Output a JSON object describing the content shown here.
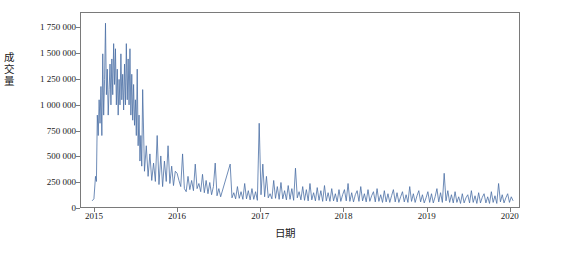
{
  "chart_data": {
    "type": "line",
    "title": "",
    "xlabel": "日期",
    "ylabel": "成交量",
    "xlim": [
      "2014-11-01",
      "2020-02-15"
    ],
    "ylim": [
      0,
      1900000
    ],
    "grid": false,
    "legend": null,
    "line_color": "#4a6fa5",
    "axis_color": "#7a7a7a",
    "yticks": [
      {
        "value": 0,
        "label": "0"
      },
      {
        "value": 250000,
        "label": "250 000"
      },
      {
        "value": 500000,
        "label": "500 000"
      },
      {
        "value": 750000,
        "label": "750 000"
      },
      {
        "value": 1000000,
        "label": "1 000 000"
      },
      {
        "value": 1250000,
        "label": "1 250 000"
      },
      {
        "value": 1500000,
        "label": "1 500 000"
      },
      {
        "value": 1750000,
        "label": "1 750 000"
      }
    ],
    "xticks": [
      {
        "value": "2015-01-01",
        "label": "2015"
      },
      {
        "value": "2016-01-01",
        "label": "2016"
      },
      {
        "value": "2017-01-01",
        "label": "2017"
      },
      {
        "value": "2018-01-01",
        "label": "2018"
      },
      {
        "value": "2019-01-01",
        "label": "2019"
      },
      {
        "value": "2020-01-01",
        "label": "2020"
      }
    ],
    "series": [
      {
        "name": "成交量",
        "x": [
          "2014-12-20",
          "2014-12-28",
          "2015-01-04",
          "2015-01-08",
          "2015-01-12",
          "2015-01-16",
          "2015-01-20",
          "2015-01-24",
          "2015-01-28",
          "2015-02-01",
          "2015-02-05",
          "2015-02-09",
          "2015-02-13",
          "2015-02-17",
          "2015-02-21",
          "2015-02-25",
          "2015-03-01",
          "2015-03-05",
          "2015-03-09",
          "2015-03-13",
          "2015-03-17",
          "2015-03-21",
          "2015-03-25",
          "2015-03-29",
          "2015-04-02",
          "2015-04-06",
          "2015-04-10",
          "2015-04-14",
          "2015-04-18",
          "2015-04-22",
          "2015-04-26",
          "2015-04-30",
          "2015-05-04",
          "2015-05-08",
          "2015-05-12",
          "2015-05-16",
          "2015-05-20",
          "2015-05-24",
          "2015-05-28",
          "2015-06-01",
          "2015-06-05",
          "2015-06-09",
          "2015-06-13",
          "2015-06-17",
          "2015-06-21",
          "2015-06-25",
          "2015-06-29",
          "2015-07-03",
          "2015-07-07",
          "2015-07-11",
          "2015-07-15",
          "2015-07-19",
          "2015-07-23",
          "2015-07-27",
          "2015-07-31",
          "2015-08-08",
          "2015-08-16",
          "2015-08-24",
          "2015-09-01",
          "2015-09-09",
          "2015-09-17",
          "2015-09-25",
          "2015-10-03",
          "2015-10-11",
          "2015-10-19",
          "2015-10-27",
          "2015-11-04",
          "2015-11-12",
          "2015-11-20",
          "2015-11-28",
          "2015-12-06",
          "2015-12-14",
          "2015-12-22",
          "2015-12-30",
          "2016-01-07",
          "2016-01-15",
          "2016-01-23",
          "2016-01-31",
          "2016-02-08",
          "2016-02-16",
          "2016-02-24",
          "2016-03-03",
          "2016-03-11",
          "2016-03-19",
          "2016-03-27",
          "2016-04-04",
          "2016-04-12",
          "2016-04-20",
          "2016-04-28",
          "2016-05-06",
          "2016-05-14",
          "2016-05-22",
          "2016-05-30",
          "2016-06-07",
          "2016-06-15",
          "2016-06-23",
          "2016-07-01",
          "2016-07-09",
          "2016-08-20",
          "2016-08-28",
          "2016-09-05",
          "2016-09-13",
          "2016-09-21",
          "2016-09-29",
          "2016-10-07",
          "2016-10-15",
          "2016-10-23",
          "2016-10-31",
          "2016-11-08",
          "2016-11-16",
          "2016-11-24",
          "2016-12-02",
          "2016-12-10",
          "2016-12-18",
          "2016-12-26",
          "2017-01-03",
          "2017-01-11",
          "2017-01-19",
          "2017-01-27",
          "2017-02-04",
          "2017-02-12",
          "2017-02-20",
          "2017-02-28",
          "2017-03-08",
          "2017-03-16",
          "2017-03-24",
          "2017-04-01",
          "2017-04-09",
          "2017-04-17",
          "2017-04-25",
          "2017-05-03",
          "2017-05-11",
          "2017-05-19",
          "2017-05-27",
          "2017-06-04",
          "2017-06-12",
          "2017-06-20",
          "2017-06-28",
          "2017-07-06",
          "2017-07-14",
          "2017-07-22",
          "2017-07-30",
          "2017-08-07",
          "2017-08-15",
          "2017-08-23",
          "2017-08-31",
          "2017-09-08",
          "2017-09-16",
          "2017-09-24",
          "2017-10-02",
          "2017-10-10",
          "2017-10-18",
          "2017-10-26",
          "2017-11-03",
          "2017-11-11",
          "2017-11-19",
          "2017-11-27",
          "2017-12-05",
          "2017-12-13",
          "2017-12-21",
          "2017-12-29",
          "2018-01-06",
          "2018-01-14",
          "2018-01-22",
          "2018-01-30",
          "2018-02-07",
          "2018-02-15",
          "2018-02-23",
          "2018-03-03",
          "2018-03-11",
          "2018-03-19",
          "2018-03-27",
          "2018-04-04",
          "2018-04-12",
          "2018-04-20",
          "2018-04-28",
          "2018-05-06",
          "2018-05-14",
          "2018-05-22",
          "2018-05-30",
          "2018-06-07",
          "2018-06-15",
          "2018-06-23",
          "2018-07-01",
          "2018-07-09",
          "2018-07-17",
          "2018-07-25",
          "2018-08-02",
          "2018-08-10",
          "2018-08-18",
          "2018-08-26",
          "2018-09-03",
          "2018-09-11",
          "2018-09-19",
          "2018-09-27",
          "2018-10-05",
          "2018-10-13",
          "2018-10-21",
          "2018-10-29",
          "2018-11-06",
          "2018-11-14",
          "2018-11-22",
          "2018-11-30",
          "2018-12-08",
          "2018-12-16",
          "2018-12-24",
          "2019-01-01",
          "2019-01-09",
          "2019-01-17",
          "2019-01-25",
          "2019-02-02",
          "2019-02-10",
          "2019-02-18",
          "2019-02-26",
          "2019-03-06",
          "2019-03-14",
          "2019-03-22",
          "2019-03-30",
          "2019-04-07",
          "2019-04-15",
          "2019-04-23",
          "2019-05-01",
          "2019-05-09",
          "2019-05-17",
          "2019-05-25",
          "2019-06-02",
          "2019-06-10",
          "2019-06-18",
          "2019-06-26",
          "2019-07-04",
          "2019-07-12",
          "2019-07-20",
          "2019-07-28",
          "2019-08-05",
          "2019-08-13",
          "2019-08-21",
          "2019-08-29",
          "2019-09-06",
          "2019-09-14",
          "2019-09-22",
          "2019-09-30",
          "2019-10-08",
          "2019-10-16",
          "2019-10-24",
          "2019-11-01",
          "2019-11-09",
          "2019-11-17",
          "2019-11-25",
          "2019-12-03",
          "2019-12-11",
          "2019-12-19",
          "2019-12-27",
          "2020-01-04",
          "2020-01-12",
          "2020-01-20"
        ],
        "values": [
          60000,
          80000,
          300000,
          250000,
          900000,
          700000,
          1050000,
          820000,
          1180000,
          700000,
          1500000,
          900000,
          1250000,
          1800000,
          1100000,
          1350000,
          900000,
          1150000,
          1400000,
          1000000,
          1450000,
          1100000,
          1600000,
          1200000,
          1550000,
          1000000,
          1350000,
          900000,
          1250000,
          1000000,
          1500000,
          1050000,
          1300000,
          950000,
          1400000,
          1000000,
          1600000,
          1050000,
          1450000,
          1000000,
          1550000,
          900000,
          1300000,
          850000,
          1200000,
          800000,
          1050000,
          700000,
          1350000,
          600000,
          900000,
          450000,
          700000,
          400000,
          1150000,
          350000,
          600000,
          300000,
          520000,
          260000,
          430000,
          250000,
          700000,
          220000,
          500000,
          200000,
          450000,
          250000,
          600000,
          230000,
          400000,
          210000,
          350000,
          330000,
          260000,
          200000,
          520000,
          180000,
          150000,
          300000,
          170000,
          260000,
          160000,
          420000,
          180000,
          230000,
          150000,
          320000,
          140000,
          260000,
          130000,
          240000,
          120000,
          200000,
          430000,
          110000,
          180000,
          100000,
          420000,
          90000,
          140000,
          80000,
          200000,
          85000,
          150000,
          75000,
          230000,
          80000,
          160000,
          70000,
          180000,
          75000,
          150000,
          65000,
          820000,
          120000,
          420000,
          100000,
          300000,
          90000,
          130000,
          80000,
          260000,
          85000,
          200000,
          75000,
          240000,
          80000,
          160000,
          70000,
          210000,
          75000,
          180000,
          65000,
          380000,
          90000,
          150000,
          70000,
          200000,
          65000,
          170000,
          60000,
          230000,
          70000,
          140000,
          60000,
          190000,
          65000,
          160000,
          55000,
          210000,
          60000,
          140000,
          55000,
          180000,
          60000,
          130000,
          50000,
          170000,
          55000,
          120000,
          170000,
          60000,
          230000,
          55000,
          140000,
          50000,
          120000,
          160000,
          55000,
          200000,
          60000,
          130000,
          50000,
          170000,
          55000,
          110000,
          150000,
          50000,
          180000,
          55000,
          120000,
          45000,
          160000,
          50000,
          130000,
          45000,
          110000,
          170000,
          50000,
          140000,
          45000,
          100000,
          150000,
          50000,
          120000,
          45000,
          200000,
          55000,
          130000,
          45000,
          110000,
          160000,
          50000,
          120000,
          40000,
          90000,
          150000,
          45000,
          130000,
          40000,
          100000,
          180000,
          50000,
          140000,
          45000,
          330000,
          60000,
          160000,
          45000,
          120000,
          40000,
          150000,
          45000,
          100000,
          35000,
          130000,
          40000,
          90000,
          120000,
          40000,
          160000,
          45000,
          110000,
          35000,
          140000,
          40000,
          95000,
          130000,
          40000,
          100000,
          35000,
          150000,
          45000,
          110000,
          35000,
          230000,
          50000,
          120000,
          40000,
          90000,
          130000,
          45000,
          100000,
          60000
        ]
      }
    ]
  }
}
